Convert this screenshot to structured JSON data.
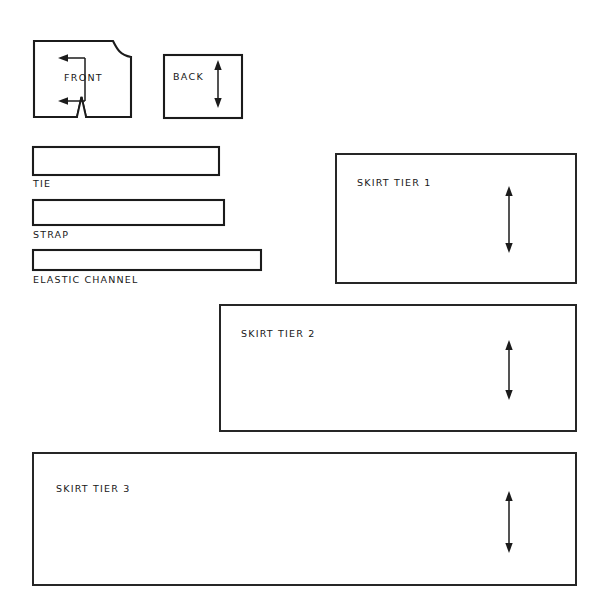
{
  "sheet": {
    "title": "Sewing Pattern Cutting Layout",
    "width": 607,
    "height": 613,
    "background_color": "#ffffff",
    "ink_color": "#1b1b1b",
    "style": "hand-drawn line art, no fill"
  },
  "bodice_pieces": [
    {
      "id": "front",
      "label": "FRONT",
      "shape": "rectangle-with-curved-neckline-and-dart-notch",
      "x": 33,
      "y": 40,
      "width": 98,
      "height": 78,
      "label_x": 64,
      "label_y": 81,
      "features": {
        "neckline_curve": "top-right corner curved inward",
        "dart_notch": "narrow V notch at bottom center",
        "arrow": {
          "type": "double-headed",
          "orientation": "vertical-with-left-pointing-heads",
          "name": "grainline-arrow"
        }
      }
    },
    {
      "id": "back",
      "label": "BACK",
      "shape": "rectangle",
      "x": 164,
      "y": 55,
      "width": 78,
      "height": 63,
      "label_x": 173,
      "label_y": 80,
      "features": {
        "arrow": {
          "type": "double-headed",
          "orientation": "vertical",
          "name": "grainline-arrow"
        }
      }
    }
  ],
  "strip_pieces": [
    {
      "id": "tie",
      "label": "TIE",
      "x": 33,
      "y": 147,
      "width": 186,
      "height": 28,
      "label_x": 33,
      "label_y": 187
    },
    {
      "id": "strap",
      "label": "STRAP",
      "x": 33,
      "y": 200,
      "width": 191,
      "height": 25,
      "label_x": 33,
      "label_y": 238
    },
    {
      "id": "elastic-channel",
      "label": "ELASTIC CHANNEL",
      "x": 33,
      "y": 250,
      "width": 228,
      "height": 20,
      "label_x": 33,
      "label_y": 283
    }
  ],
  "skirt_tiers": [
    {
      "id": "skirt-tier-1",
      "label": "SKIRT TIER 1",
      "x": 336,
      "y": 154,
      "width": 240,
      "height": 129,
      "label_x": 357,
      "label_y": 186,
      "arrow_x": 509,
      "arrow_top": 186,
      "arrow_bottom": 253
    },
    {
      "id": "skirt-tier-2",
      "label": "SKIRT TIER 2",
      "x": 220,
      "y": 305,
      "width": 356,
      "height": 126,
      "label_x": 241,
      "label_y": 337,
      "arrow_x": 509,
      "arrow_top": 340,
      "arrow_bottom": 400
    },
    {
      "id": "skirt-tier-3",
      "label": "SKIRT TIER 3",
      "x": 33,
      "y": 453,
      "width": 543,
      "height": 132,
      "label_x": 56,
      "label_y": 492,
      "arrow_x": 509,
      "arrow_top": 491,
      "arrow_bottom": 553
    }
  ]
}
